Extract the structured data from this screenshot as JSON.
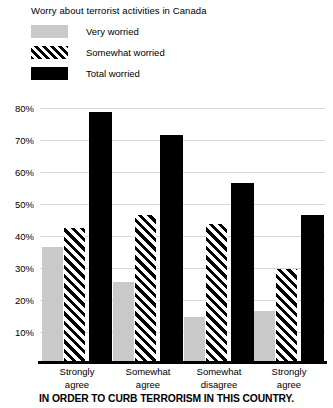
{
  "chart_data": {
    "type": "bar",
    "title": "Worry about terrorist activities in Canada",
    "xlabel": "IN ORDER TO CURB TERRORISM IN THIS COUNTRY.",
    "ylabel": "",
    "categories": [
      "Strongly agree",
      "Somewhat agree",
      "Somewhat disagree",
      "Strongly agree"
    ],
    "category_lines": [
      [
        "Strongly",
        "agree"
      ],
      [
        "Somewhat",
        "agree"
      ],
      [
        "Somewhat",
        "disagree"
      ],
      [
        "Strongly",
        "agree"
      ]
    ],
    "series": [
      {
        "name": "Very worried",
        "values": [
          36,
          25,
          14,
          16
        ],
        "swatch": "gray",
        "color": "#c9c9c9"
      },
      {
        "name": "Somewhat worried",
        "values": [
          42,
          46,
          43,
          29
        ],
        "swatch": "hatch",
        "color": "#000000"
      },
      {
        "name": "Total worried",
        "values": [
          78,
          71,
          56,
          46
        ],
        "swatch": "black",
        "color": "#000000"
      }
    ],
    "ylim": [
      0,
      85
    ],
    "yticks": [
      10,
      20,
      30,
      40,
      50,
      60,
      70,
      80
    ],
    "ytick_labels": [
      "10%",
      "20%",
      "30%",
      "40%",
      "50%",
      "60%",
      "70%",
      "80%"
    ],
    "grid": true,
    "legend_position": "top-left"
  },
  "legend": {
    "items": [
      {
        "label": "Very worried"
      },
      {
        "label": "Somewhat worried"
      },
      {
        "label": "Total worried"
      }
    ]
  }
}
